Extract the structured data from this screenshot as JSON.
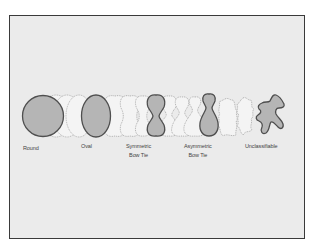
{
  "diagram": {
    "title": "",
    "colors": {
      "background": "#ffffff",
      "panel": "#ebebeb",
      "border": "#3a3a3a",
      "shape_fill": "#b5b5b5",
      "shape_stroke": "#4f4f4f",
      "intermediate_fill": "#f4f4f4",
      "intermediate_stroke": "#9a9a9a",
      "label_color": "#444444"
    },
    "categories": [
      {
        "id": "round",
        "line1": "Round",
        "line2": ""
      },
      {
        "id": "oval",
        "line1": "Oval",
        "line2": ""
      },
      {
        "id": "symmetric-bow-tie",
        "line1": "Symmetric",
        "line2": "Bow Tie"
      },
      {
        "id": "asymmetric-bow-tie",
        "line1": "Asymmetric",
        "line2": "Bow Tie"
      },
      {
        "id": "unclassifiable",
        "line1": "Unclassifiable",
        "line2": ""
      }
    ]
  }
}
